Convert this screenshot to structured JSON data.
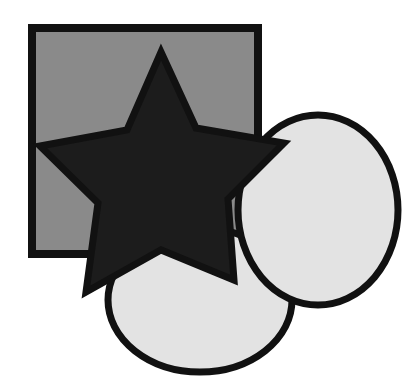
{
  "diagram": {
    "colors": {
      "background": "#ffffff",
      "square_fill": "#8a8a8a",
      "star_fill": "#1c1c1c",
      "circle_fill": "#e3e3e3",
      "stroke": "#111111"
    },
    "shapes": [
      {
        "id": "square",
        "type": "rect",
        "x": 32,
        "y": 28,
        "width": 226,
        "height": 226
      },
      {
        "id": "bottom-circle",
        "type": "ellipse",
        "cx": 200,
        "cy": 300,
        "rx": 92,
        "ry": 72
      },
      {
        "id": "right-circle",
        "type": "ellipse",
        "cx": 318,
        "cy": 210,
        "rx": 80,
        "ry": 95
      },
      {
        "id": "star",
        "type": "star",
        "points": "161,52 196,128 284,143 228,199 234,280 161,250 86,292 98,203 40,146 127,130"
      }
    ]
  }
}
